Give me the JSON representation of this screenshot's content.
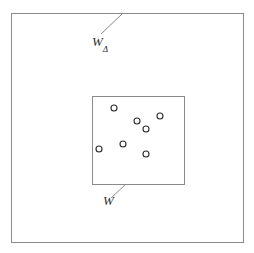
{
  "figure": {
    "background_color": "#ffffff",
    "line_color": "#8a8a8a",
    "marker_stroke_color": "#2b2b2b",
    "marker_fill_color": "#ffffff",
    "label_color": "#303030",
    "outer_window": {
      "name": "outer-window-rect",
      "x": 11,
      "y": 13,
      "width": 232,
      "height": 229
    },
    "inner_window": {
      "name": "inner-window-rect",
      "x": 92,
      "y": 96,
      "width": 92,
      "height": 88
    },
    "labels": {
      "outer": {
        "base": "W",
        "subscript": "Δ",
        "full_text": "WΔ"
      },
      "inner": {
        "base": "W",
        "subscript": "",
        "full_text": "W"
      }
    },
    "leader_lines": [
      {
        "name": "leader-line-outer",
        "x1": 101,
        "y1": 34,
        "x2": 122,
        "y2": 14
      },
      {
        "name": "leader-line-inner",
        "x1": 111,
        "y1": 198,
        "x2": 126,
        "y2": 184
      }
    ],
    "points": [
      {
        "cx": 114,
        "cy": 108,
        "r": 3.0
      },
      {
        "cx": 137,
        "cy": 121,
        "r": 3.0
      },
      {
        "cx": 160,
        "cy": 116,
        "r": 3.0
      },
      {
        "cx": 146,
        "cy": 129,
        "r": 3.0
      },
      {
        "cx": 99,
        "cy": 149,
        "r": 3.0
      },
      {
        "cx": 123,
        "cy": 144,
        "r": 3.0
      },
      {
        "cx": 146,
        "cy": 154,
        "r": 3.0
      }
    ]
  }
}
